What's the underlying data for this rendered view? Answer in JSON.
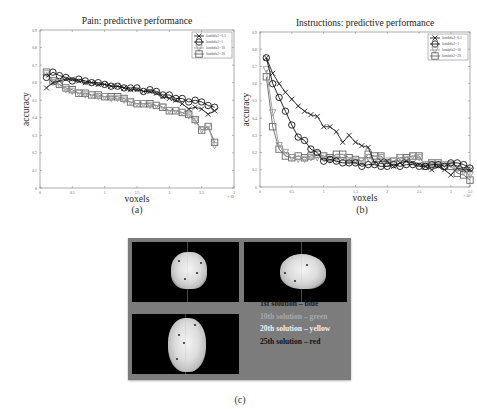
{
  "figure": {
    "panels": {
      "a": {
        "caption": "(a)"
      },
      "b": {
        "caption": "(b)"
      },
      "c": {
        "caption": "(c)"
      }
    }
  },
  "chart_data": [
    {
      "id": "a",
      "type": "line",
      "title": "Pain: predictive performance",
      "xlabel": "voxels",
      "ylabel": "accuracy",
      "x_multiplier": "× 10⁴",
      "xlim": [
        0,
        3
      ],
      "ylim": [
        0,
        0.9
      ],
      "xticks": [
        "0",
        "0.5",
        "1",
        "1.5",
        "2",
        "2.5",
        "3"
      ],
      "yticks": [
        "0",
        "0.1",
        "0.2",
        "0.3",
        "0.4",
        "0.5",
        "0.6",
        "0.7",
        "0.8",
        "0.9"
      ],
      "grid": false,
      "legend_position": "upper right",
      "x": [
        0.1,
        0.2,
        0.3,
        0.4,
        0.5,
        0.6,
        0.7,
        0.8,
        0.9,
        1.0,
        1.1,
        1.2,
        1.3,
        1.4,
        1.5,
        1.6,
        1.7,
        1.8,
        1.9,
        2.0,
        2.1,
        2.2,
        2.3,
        2.4,
        2.5,
        2.6,
        2.7
      ],
      "series": [
        {
          "name": "lambda2=0.1",
          "marker": "x",
          "color": "#222222",
          "values": [
            0.57,
            0.6,
            0.61,
            0.62,
            0.62,
            0.61,
            0.6,
            0.6,
            0.59,
            0.59,
            0.58,
            0.58,
            0.57,
            0.56,
            0.56,
            0.55,
            0.55,
            0.54,
            0.52,
            0.51,
            0.5,
            0.48,
            0.45,
            0.46,
            0.45,
            0.42,
            0.44
          ]
        },
        {
          "name": "lambda2=1",
          "marker": "o",
          "color": "#111111",
          "values": [
            0.63,
            0.66,
            0.64,
            0.63,
            0.61,
            0.62,
            0.61,
            0.6,
            0.6,
            0.59,
            0.58,
            0.58,
            0.57,
            0.57,
            0.57,
            0.55,
            0.56,
            0.55,
            0.53,
            0.53,
            0.51,
            0.51,
            0.49,
            0.5,
            0.49,
            0.47,
            0.46
          ]
        },
        {
          "name": "lambda2=10",
          "marker": "v",
          "color": "#9a9a9a",
          "values": [
            0.65,
            0.6,
            0.59,
            0.56,
            0.55,
            0.54,
            0.53,
            0.53,
            0.52,
            0.52,
            0.51,
            0.51,
            0.5,
            0.49,
            0.48,
            0.48,
            0.47,
            0.47,
            0.46,
            0.44,
            0.44,
            0.43,
            0.41,
            0.38,
            0.33,
            0.35,
            0.24
          ]
        },
        {
          "name": "lambda2=20",
          "marker": "s",
          "color": "#666666",
          "values": [
            0.66,
            0.61,
            0.59,
            0.57,
            0.56,
            0.54,
            0.54,
            0.53,
            0.53,
            0.52,
            0.52,
            0.52,
            0.51,
            0.49,
            0.48,
            0.48,
            0.48,
            0.47,
            0.46,
            0.44,
            0.44,
            0.43,
            0.42,
            0.39,
            0.33,
            0.35,
            0.26
          ]
        }
      ]
    },
    {
      "id": "b",
      "type": "line",
      "title": "Instructions: predictive performance",
      "xlabel": "voxels",
      "ylabel": "accuracy",
      "x_multiplier": "× 10⁴",
      "xlim": [
        0,
        3.3
      ],
      "ylim": [
        0,
        0.9
      ],
      "xticks": [
        "0",
        "0.5",
        "1",
        "1.5",
        "2",
        "2.5",
        "3",
        "3.3"
      ],
      "yticks": [
        "0",
        "0.1",
        "0.2",
        "0.3",
        "0.4",
        "0.5",
        "0.6",
        "0.7",
        "0.8",
        "0.9"
      ],
      "grid": false,
      "legend_position": "upper right",
      "x": [
        0.1,
        0.2,
        0.3,
        0.4,
        0.5,
        0.6,
        0.7,
        0.8,
        0.9,
        1.0,
        1.1,
        1.2,
        1.3,
        1.4,
        1.5,
        1.6,
        1.7,
        1.8,
        1.9,
        2.0,
        2.1,
        2.2,
        2.3,
        2.4,
        2.5,
        2.6,
        2.7,
        2.8,
        2.9,
        3.0,
        3.1,
        3.2,
        3.3
      ],
      "series": [
        {
          "name": "lambda2=0.1",
          "marker": "x",
          "color": "#222222",
          "values": [
            0.75,
            0.66,
            0.6,
            0.55,
            0.51,
            0.47,
            0.44,
            0.42,
            0.41,
            0.35,
            0.35,
            0.32,
            0.26,
            0.3,
            0.26,
            0.24,
            0.23,
            0.14,
            0.15,
            0.15,
            0.12,
            0.14,
            0.15,
            0.14,
            0.13,
            0.12,
            0.1,
            0.12,
            0.1,
            0.07,
            0.11,
            0.1,
            0.1
          ]
        },
        {
          "name": "lambda2=1",
          "marker": "o",
          "color": "#111111",
          "values": [
            0.75,
            0.6,
            0.52,
            0.44,
            0.36,
            0.29,
            0.27,
            0.22,
            0.2,
            0.15,
            0.16,
            0.15,
            0.14,
            0.14,
            0.14,
            0.12,
            0.13,
            0.13,
            0.12,
            0.12,
            0.13,
            0.12,
            0.13,
            0.13,
            0.12,
            0.12,
            0.13,
            0.13,
            0.12,
            0.14,
            0.14,
            0.13,
            0.11
          ]
        },
        {
          "name": "lambda2=10",
          "marker": "v",
          "color": "#9a9a9a",
          "values": [
            0.68,
            0.43,
            0.24,
            0.2,
            0.17,
            0.16,
            0.16,
            0.17,
            0.17,
            0.18,
            0.16,
            0.16,
            0.17,
            0.15,
            0.15,
            0.15,
            0.17,
            0.16,
            0.17,
            0.15,
            0.15,
            0.17,
            0.16,
            0.18,
            0.17,
            0.13,
            0.14,
            0.14,
            0.13,
            0.13,
            0.1,
            0.09,
            0.07
          ]
        },
        {
          "name": "lambda2=20",
          "marker": "s",
          "color": "#666666",
          "values": [
            0.64,
            0.35,
            0.22,
            0.18,
            0.17,
            0.18,
            0.17,
            0.18,
            0.19,
            0.18,
            0.17,
            0.19,
            0.19,
            0.17,
            0.16,
            0.15,
            0.19,
            0.18,
            0.18,
            0.14,
            0.15,
            0.17,
            0.17,
            0.18,
            0.18,
            0.12,
            0.14,
            0.14,
            0.12,
            0.12,
            0.08,
            0.07,
            0.04
          ]
        }
      ]
    }
  ],
  "brain_legend": [
    {
      "label": "1st solution – blue",
      "color": "#1a1a1a"
    },
    {
      "label": "10th solution – green",
      "color": "#a8a8a8"
    },
    {
      "label": "20th solution – yellow",
      "color": "#f2f2f2"
    },
    {
      "label": "25th solution – red",
      "color": "#111111"
    }
  ]
}
